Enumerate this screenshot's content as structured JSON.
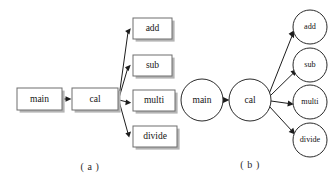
{
  "figure": {
    "background_color": "#ffffff",
    "line_color": "#1d1d1d",
    "box_border_color": "#6e6e6e",
    "box_fill_color": "#ffffff",
    "box_shadow_color": "#b4b4b4",
    "ellipse_border_color": "#2a2a2a",
    "text_color": "#141414"
  },
  "panel_a": {
    "caption": "( a )",
    "caption_x": 90,
    "caption_y": 168,
    "shape": "rectangle",
    "nodes": [
      {
        "id": "main",
        "label": "main",
        "x": 17,
        "y": 88,
        "w": 45,
        "h": 22
      },
      {
        "id": "cal",
        "label": "cal",
        "x": 72,
        "y": 88,
        "w": 46,
        "h": 22
      },
      {
        "id": "add",
        "label": "add",
        "x": 133,
        "y": 18,
        "w": 39,
        "h": 21
      },
      {
        "id": "sub",
        "label": "sub",
        "x": 133,
        "y": 55,
        "w": 39,
        "h": 21
      },
      {
        "id": "multi",
        "label": "multi",
        "x": 133,
        "y": 90,
        "w": 42,
        "h": 21
      },
      {
        "id": "divide",
        "label": "divide",
        "x": 133,
        "y": 126,
        "w": 44,
        "h": 21
      }
    ],
    "edges": [
      {
        "from": "main",
        "to": "cal"
      },
      {
        "from": "cal",
        "to": "add"
      },
      {
        "from": "cal",
        "to": "sub"
      },
      {
        "from": "cal",
        "to": "multi"
      },
      {
        "from": "cal",
        "to": "divide"
      }
    ]
  },
  "panel_b": {
    "caption": "( b )",
    "caption_x": 250,
    "caption_y": 166,
    "shape": "ellipse",
    "nodes": [
      {
        "id": "main",
        "label": "main",
        "cx": 202,
        "cy": 100,
        "rx": 21,
        "ry": 21
      },
      {
        "id": "cal",
        "label": "cal",
        "cx": 250,
        "cy": 100,
        "rx": 21,
        "ry": 21
      },
      {
        "id": "add",
        "label": "add",
        "cx": 310,
        "cy": 27,
        "rx": 17,
        "ry": 17
      },
      {
        "id": "sub",
        "label": "sub",
        "cx": 310,
        "cy": 65,
        "rx": 17,
        "ry": 17
      },
      {
        "id": "multi",
        "label": "multi",
        "cx": 310,
        "cy": 102,
        "rx": 17,
        "ry": 17
      },
      {
        "id": "divide",
        "label": "divide",
        "cx": 310,
        "cy": 140,
        "rx": 17,
        "ry": 17
      }
    ],
    "edges": [
      {
        "from": "main",
        "to": "cal"
      },
      {
        "from": "cal",
        "to": "add"
      },
      {
        "from": "cal",
        "to": "sub"
      },
      {
        "from": "cal",
        "to": "multi"
      },
      {
        "from": "cal",
        "to": "divide"
      }
    ]
  }
}
